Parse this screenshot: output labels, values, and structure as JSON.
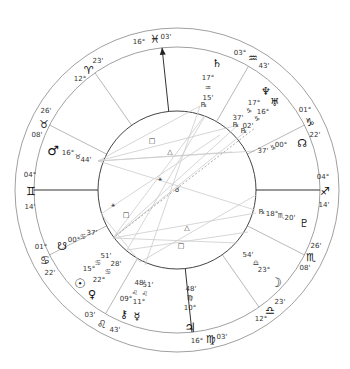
{
  "chart": {
    "center": [
      177,
      190
    ],
    "radii": {
      "outer": 162,
      "middle": 143,
      "inner": 79
    },
    "colors": {
      "ring": "#888888",
      "cusp": "#555555",
      "angle": "#333333",
      "aspect": "#cccccc",
      "text": "#333333",
      "glyph": "#111111"
    }
  },
  "cusps": [
    {
      "id": "asc",
      "angle": 180,
      "deg": "04°",
      "sign": "♊",
      "min": "14'",
      "degPos": [
        30,
        175
      ],
      "signPos": [
        31,
        191
      ],
      "minPos": [
        30,
        207
      ]
    },
    {
      "id": "h12",
      "angle": 207,
      "deg": "26'",
      "sign": "♉",
      "min": "08'",
      "degPos": [
        46,
        111
      ],
      "signPos": [
        44,
        124
      ],
      "minPos": [
        37,
        135
      ]
    },
    {
      "id": "h11",
      "angle": 235,
      "deg": "12°",
      "sign": "♈",
      "min": "23'",
      "degPos": [
        80,
        79
      ],
      "signPos": [
        89,
        70
      ],
      "minPos": [
        98,
        61
      ]
    },
    {
      "id": "mc",
      "angle": 264,
      "deg": "16°",
      "sign": "♓",
      "min": "03'",
      "degPos": [
        139,
        42
      ],
      "signPos": [
        155,
        39
      ],
      "minPos": [
        166,
        37
      ]
    },
    {
      "id": "h9",
      "angle": 300,
      "deg": "03°",
      "sign": "♒",
      "min": "43'",
      "degPos": [
        240,
        53
      ],
      "signPos": [
        253,
        58
      ],
      "minPos": [
        264,
        66
      ]
    },
    {
      "id": "h8",
      "angle": 333,
      "deg": "01°",
      "sign": "♑",
      "min": "22'",
      "degPos": [
        305,
        110
      ],
      "signPos": [
        310,
        122
      ],
      "minPos": [
        315,
        135
      ]
    },
    {
      "id": "dsc",
      "angle": 0,
      "deg": "04°",
      "sign": "♐",
      "min": "14'",
      "degPos": [
        323,
        177
      ],
      "signPos": [
        325,
        191
      ],
      "minPos": [
        324,
        205
      ]
    },
    {
      "id": "h6",
      "angle": 27,
      "deg": "26'",
      "sign": "♏",
      "min": "08'",
      "degPos": [
        316,
        246
      ],
      "signPos": [
        311,
        257
      ],
      "minPos": [
        305,
        268
      ]
    },
    {
      "id": "h5",
      "angle": 55,
      "deg": "12°",
      "sign": "♎",
      "min": "23'",
      "degPos": [
        261,
        319
      ],
      "signPos": [
        270,
        310
      ],
      "minPos": [
        280,
        302
      ]
    },
    {
      "id": "ic",
      "angle": 84,
      "deg": "16°",
      "sign": "♍",
      "min": "03'",
      "degPos": [
        197,
        341
      ],
      "signPos": [
        211,
        339
      ],
      "minPos": [
        222,
        337
      ]
    },
    {
      "id": "h3",
      "angle": 120,
      "deg": "03'",
      "sign": "♌",
      "min": "43'",
      "degPos": [
        90,
        315
      ],
      "signPos": [
        102,
        324
      ],
      "minPos": [
        115,
        330
      ]
    },
    {
      "id": "h2",
      "angle": 153,
      "deg": "01°",
      "sign": "♋",
      "min": "22'",
      "degPos": [
        41,
        247
      ],
      "signPos": [
        45,
        260
      ],
      "minPos": [
        50,
        273
      ]
    }
  ],
  "planets": [
    {
      "name": "saturn",
      "glyph": "♄",
      "pos": [
        217,
        63
      ],
      "labels": [
        {
          "t": "17°",
          "p": [
            208,
            78
          ]
        },
        {
          "t": "♒",
          "p": [
            208,
            88
          ]
        },
        {
          "t": "15'",
          "p": [
            208,
            98
          ]
        },
        {
          "t": "℞",
          "p": [
            204,
            105
          ]
        }
      ]
    },
    {
      "name": "neptune",
      "glyph": "♆",
      "pos": [
        266,
        91
      ],
      "labels": [
        {
          "t": "17°",
          "p": [
            254,
            103
          ]
        },
        {
          "t": "♑",
          "p": [
            249,
            111
          ]
        },
        {
          "t": "37'",
          "p": [
            238,
            118
          ]
        },
        {
          "t": "℞",
          "p": [
            236,
            125
          ]
        }
      ]
    },
    {
      "name": "uranus",
      "glyph": "♅",
      "pos": [
        275,
        102
      ],
      "labels": [
        {
          "t": "16°",
          "p": [
            263,
            112
          ]
        },
        {
          "t": "♑",
          "p": [
            257,
            119
          ]
        },
        {
          "t": "02'",
          "p": [
            248,
            126
          ]
        },
        {
          "t": "℞",
          "p": [
            244,
            131
          ]
        }
      ]
    },
    {
      "name": "north-node",
      "glyph": "☊",
      "pos": [
        302,
        143
      ],
      "labels": [
        {
          "t": "00°",
          "p": [
            281,
            145
          ]
        },
        {
          "t": "♑",
          "p": [
            273,
            148
          ]
        },
        {
          "t": "37'",
          "p": [
            263,
            151
          ]
        }
      ]
    },
    {
      "name": "mars",
      "glyph": "♂",
      "pos": [
        53,
        150
      ],
      "labels": [
        {
          "t": "16°",
          "p": [
            68,
            153
          ]
        },
        {
          "t": "♉",
          "p": [
            78,
            157
          ]
        },
        {
          "t": "44'",
          "p": [
            86,
            160
          ]
        }
      ]
    },
    {
      "name": "pluto",
      "glyph": "♇",
      "pos": [
        304,
        223
      ],
      "labels": [
        {
          "t": "℞",
          "p": [
            262,
            212
          ]
        },
        {
          "t": "18°",
          "p": [
            272,
            214
          ]
        },
        {
          "t": "♏",
          "p": [
            281,
            216
          ]
        },
        {
          "t": "20'",
          "p": [
            290,
            218
          ]
        }
      ]
    },
    {
      "name": "moon",
      "glyph": "☽",
      "pos": [
        276,
        282
      ],
      "labels": [
        {
          "t": "54'",
          "p": [
            248,
            255
          ]
        },
        {
          "t": "♎",
          "p": [
            256,
            263
          ]
        },
        {
          "t": "23°",
          "p": [
            264,
            270
          ]
        }
      ]
    },
    {
      "name": "jupiter",
      "glyph": "♃",
      "pos": [
        190,
        327
      ],
      "labels": [
        {
          "t": "48'",
          "p": [
            191,
            289
          ]
        },
        {
          "t": "♍",
          "p": [
            190,
            298
          ]
        },
        {
          "t": "10°",
          "p": [
            190,
            308
          ]
        }
      ]
    },
    {
      "name": "south-node",
      "glyph": "☋",
      "pos": [
        62,
        246
      ],
      "labels": [
        {
          "t": "00°",
          "p": [
            74,
            240
          ]
        },
        {
          "t": "♋",
          "p": [
            83,
            237
          ]
        },
        {
          "t": "37'",
          "p": [
            92,
            233
          ]
        }
      ]
    },
    {
      "name": "sun",
      "glyph": "☉",
      "pos": [
        80,
        283
      ],
      "labels": [
        {
          "t": "15°",
          "p": [
            89,
            269
          ]
        },
        {
          "t": "♋",
          "p": [
            98,
            263
          ]
        },
        {
          "t": "51'",
          "p": [
            106,
            256
          ]
        }
      ]
    },
    {
      "name": "venus",
      "glyph": "♀",
      "pos": [
        92,
        294
      ],
      "labels": [
        {
          "t": "22°",
          "p": [
            99,
            280
          ]
        },
        {
          "t": "♋",
          "p": [
            108,
            272
          ]
        },
        {
          "t": "28'",
          "p": [
            116,
            264
          ]
        }
      ]
    },
    {
      "name": "chiron",
      "glyph": "⚷",
      "pos": [
        124,
        314
      ],
      "labels": [
        {
          "t": "09°",
          "p": [
            126,
            299
          ]
        },
        {
          "t": "♌",
          "p": [
            135,
            293
          ]
        },
        {
          "t": "48'",
          "p": [
            140,
            283
          ]
        }
      ]
    },
    {
      "name": "mercury",
      "glyph": "☿",
      "pos": [
        137,
        316
      ],
      "labels": [
        {
          "t": "11°",
          "p": [
            139,
            302
          ]
        },
        {
          "t": "♌",
          "p": [
            145,
            294
          ]
        },
        {
          "t": "51'",
          "p": [
            148,
            285
          ]
        }
      ]
    }
  ],
  "aspects": {
    "lines": [
      [
        [
          98,
          161
        ],
        [
          200,
          106
        ]
      ],
      [
        [
          98,
          161
        ],
        [
          238,
          125
        ]
      ],
      [
        [
          98,
          161
        ],
        [
          255,
          151
        ]
      ],
      [
        [
          98,
          161
        ],
        [
          232,
          152
        ]
      ],
      [
        [
          98,
          161
        ],
        [
          255,
          210
        ]
      ],
      [
        [
          113,
          238
        ],
        [
          238,
          125
        ]
      ],
      [
        [
          113,
          238
        ],
        [
          245,
          132
        ]
      ],
      [
        [
          113,
          238
        ],
        [
          205,
          115
        ]
      ],
      [
        [
          113,
          238
        ],
        [
          256,
          213
        ]
      ],
      [
        [
          113,
          238
        ],
        [
          237,
          243
        ]
      ],
      [
        [
          127,
          250
        ],
        [
          205,
          116
        ]
      ],
      [
        [
          127,
          250
        ],
        [
          248,
          232
        ]
      ],
      [
        [
          101,
          214
        ],
        [
          220,
          135
        ]
      ],
      [
        [
          101,
          214
        ],
        [
          140,
          262
        ]
      ],
      [
        [
          145,
          265
        ],
        [
          200,
          106
        ]
      ],
      [
        [
          140,
          262
        ],
        [
          256,
          195
        ]
      ]
    ],
    "symbols": [
      {
        "t": "□",
        "p": [
          152,
          141
        ]
      },
      {
        "t": "△",
        "p": [
          170,
          152
        ]
      },
      {
        "t": "⚹",
        "p": [
          160,
          179
        ]
      },
      {
        "t": "☌",
        "p": [
          177,
          190
        ]
      },
      {
        "t": "⚹",
        "p": [
          113,
          205
        ]
      },
      {
        "t": "□",
        "p": [
          126,
          215
        ]
      },
      {
        "t": "△",
        "p": [
          187,
          228
        ]
      },
      {
        "t": "□",
        "p": [
          181,
          246
        ]
      }
    ]
  }
}
